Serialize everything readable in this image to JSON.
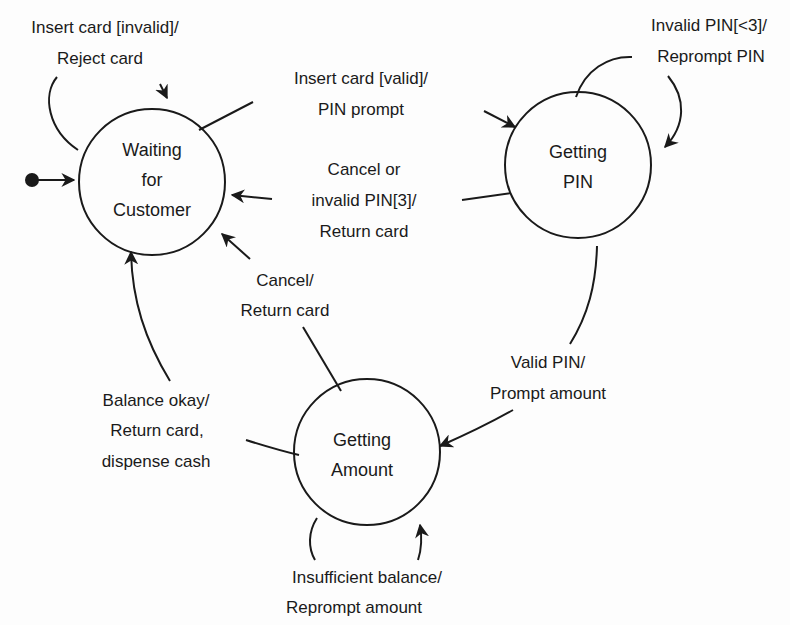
{
  "diagram": {
    "type": "state-machine",
    "colors": {
      "line": "#1a1a1a",
      "background": "#fdfdfd"
    },
    "initial": {
      "target": "waiting"
    },
    "states": [
      {
        "id": "waiting",
        "lines": [
          "Waiting",
          "for",
          "Customer"
        ]
      },
      {
        "id": "pin",
        "lines": [
          "Getting",
          "PIN"
        ]
      },
      {
        "id": "amount",
        "lines": [
          "Getting",
          "Amount"
        ]
      }
    ],
    "transitions": [
      {
        "id": "t1",
        "from": "waiting",
        "to": "waiting",
        "lines": [
          "Insert card [invalid]/",
          "Reject card"
        ]
      },
      {
        "id": "t2",
        "from": "waiting",
        "to": "pin",
        "lines": [
          "Insert card [valid]/",
          "PIN prompt"
        ]
      },
      {
        "id": "t3",
        "from": "pin",
        "to": "pin",
        "lines": [
          "Invalid PIN[<3]/",
          "Reprompt PIN"
        ]
      },
      {
        "id": "t4",
        "from": "pin",
        "to": "waiting",
        "lines": [
          "Cancel or",
          "invalid PIN[3]/",
          "Return card"
        ]
      },
      {
        "id": "t5",
        "from": "amount",
        "to": "waiting",
        "lines": [
          "Cancel/",
          "Return card"
        ]
      },
      {
        "id": "t6",
        "from": "pin",
        "to": "amount",
        "lines": [
          "Valid PIN/",
          "Prompt amount"
        ]
      },
      {
        "id": "t7",
        "from": "amount",
        "to": "waiting",
        "lines": [
          "Balance okay/",
          "Return card,",
          "dispense cash"
        ]
      },
      {
        "id": "t8",
        "from": "amount",
        "to": "amount",
        "lines": [
          "Insufficient balance/",
          "Reprompt amount"
        ]
      }
    ]
  }
}
